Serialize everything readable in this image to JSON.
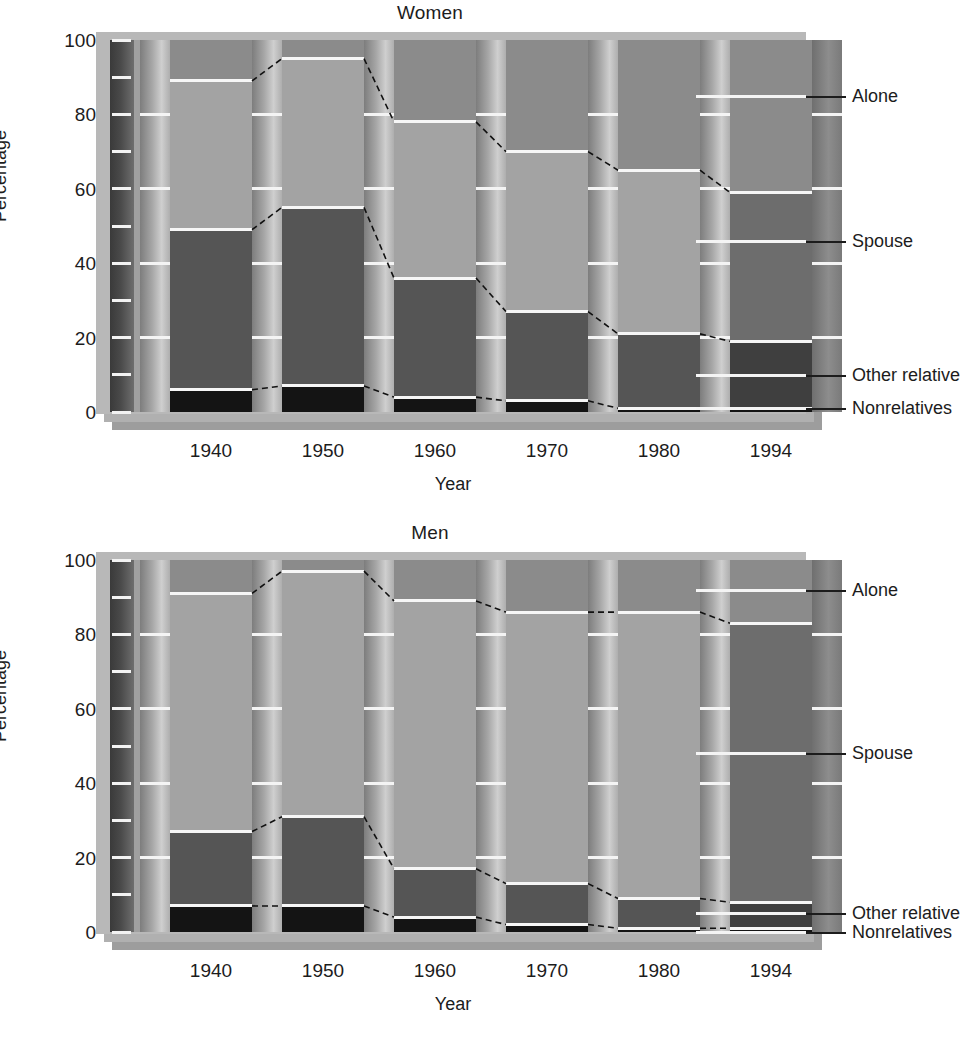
{
  "chart_data": [
    {
      "type": "bar",
      "title": "Women",
      "xlabel": "Year",
      "ylabel": "Percentage",
      "ylim": [
        0,
        100
      ],
      "grid": false,
      "stacked": true,
      "legend_position": "right",
      "categories": [
        "1940",
        "1950",
        "1960",
        "1970",
        "1980",
        "1994"
      ],
      "y_ticks_major": [
        "0",
        "20",
        "40",
        "60",
        "80",
        "100"
      ],
      "y_ticks_minor": [
        10,
        30,
        50,
        70,
        90
      ],
      "series": [
        {
          "name": "Nonrelatives",
          "values": [
            6,
            7,
            4,
            3,
            1,
            1
          ]
        },
        {
          "name": "Other relatives",
          "values": [
            43,
            48,
            32,
            24,
            20,
            18
          ]
        },
        {
          "name": "Spouse",
          "values": [
            40,
            40,
            42,
            43,
            44,
            40
          ]
        },
        {
          "name": "Alone",
          "values": [
            11,
            5,
            22,
            30,
            35,
            41
          ]
        }
      ],
      "cumulative_tops": {
        "Nonrelatives": [
          6,
          7,
          4,
          3,
          1,
          1
        ],
        "Other relatives": [
          49,
          55,
          36,
          27,
          21,
          19
        ],
        "Spouse": [
          89,
          95,
          78,
          70,
          65,
          59
        ],
        "Alone": [
          100,
          100,
          100,
          100,
          100,
          100
        ]
      }
    },
    {
      "type": "bar",
      "title": "Men",
      "xlabel": "Year",
      "ylabel": "Percentage",
      "ylim": [
        0,
        100
      ],
      "grid": false,
      "stacked": true,
      "legend_position": "right",
      "categories": [
        "1940",
        "1950",
        "1960",
        "1970",
        "1980",
        "1994"
      ],
      "y_ticks_major": [
        "0",
        "20",
        "40",
        "60",
        "80",
        "100"
      ],
      "y_ticks_minor": [
        10,
        30,
        50,
        70,
        90
      ],
      "series": [
        {
          "name": "Nonrelatives",
          "values": [
            7,
            7,
            4,
            2,
            1,
            1
          ]
        },
        {
          "name": "Other relatives",
          "values": [
            20,
            24,
            13,
            11,
            8,
            7
          ]
        },
        {
          "name": "Spouse",
          "values": [
            64,
            66,
            72,
            73,
            77,
            75
          ]
        },
        {
          "name": "Alone",
          "values": [
            9,
            3,
            11,
            14,
            14,
            17
          ]
        }
      ],
      "cumulative_tops": {
        "Nonrelatives": [
          7,
          7,
          4,
          2,
          1,
          1
        ],
        "Other relatives": [
          27,
          31,
          17,
          13,
          9,
          8
        ],
        "Spouse": [
          91,
          97,
          89,
          86,
          86,
          83
        ],
        "Alone": [
          100,
          100,
          100,
          100,
          100,
          100
        ]
      }
    }
  ],
  "panels": [
    {
      "id": "women",
      "title": "Women",
      "y_axis_title": "Percentage",
      "x_axis_title": "Year",
      "y_tick_labels": [
        "100",
        "80",
        "60",
        "40",
        "20",
        "0"
      ],
      "x_tick_labels": [
        "1940",
        "1950",
        "1960",
        "1970",
        "1980",
        "1994"
      ],
      "legend": [
        {
          "label": "Alone",
          "at_percent": 85
        },
        {
          "label": "Spouse",
          "at_percent": 46
        },
        {
          "label": "Other relatives",
          "at_percent": 10
        },
        {
          "label": "Nonrelatives",
          "at_percent": 1
        }
      ]
    },
    {
      "id": "men",
      "title": "Men",
      "y_axis_title": "Percentage",
      "x_axis_title": "Year",
      "y_tick_labels": [
        "100",
        "80",
        "60",
        "40",
        "20",
        "0"
      ],
      "x_tick_labels": [
        "1940",
        "1950",
        "1960",
        "1970",
        "1980",
        "1994"
      ],
      "legend": [
        {
          "label": "Alone",
          "at_percent": 92
        },
        {
          "label": "Spouse",
          "at_percent": 48
        },
        {
          "label": "Other relatives",
          "at_percent": 5
        },
        {
          "label": "Nonrelatives",
          "at_percent": 0
        }
      ]
    }
  ],
  "colors": {
    "alone": "#8b8b8b",
    "spouse": "#a3a3a3",
    "other_relatives": "#555555",
    "nonrelatives": "#141414",
    "plot_background": "#a0a0a0",
    "plate": "#b8b8b8",
    "separator": "#f6f6f6",
    "text": "#1c1c1c"
  }
}
